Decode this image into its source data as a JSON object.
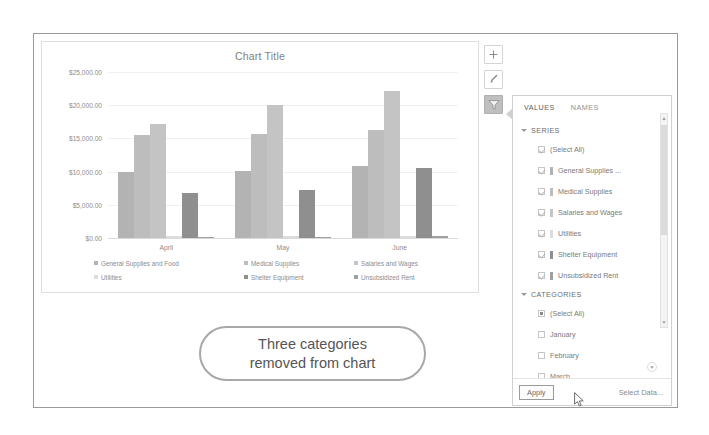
{
  "chart": {
    "title": "Chart Title",
    "buttons": [
      {
        "name": "chart-elements-button",
        "icon": "plus-icon",
        "glyph": "+"
      },
      {
        "name": "chart-styles-button",
        "icon": "paintbrush-icon",
        "glyph": "✎"
      },
      {
        "name": "chart-filters-button",
        "icon": "funnel-icon",
        "glyph": "▼"
      }
    ]
  },
  "chart_data": {
    "type": "bar",
    "title": "Chart Title",
    "xlabel": "",
    "ylabel": "",
    "ylim": [
      0,
      25000
    ],
    "grid": true,
    "legend_position": "bottom",
    "categories": [
      "April",
      "May",
      "June"
    ],
    "ytick_labels": [
      "$25,000.00",
      "$20,000.00",
      "$15,000.00",
      "$10,000.00",
      "$5,000.00",
      "$0.00"
    ],
    "ytick_values": [
      25000,
      20000,
      15000,
      10000,
      5000,
      0
    ],
    "series": [
      {
        "name": "General Supplies and Food",
        "color": "#b3b3b3",
        "values": [
          10000,
          10100,
          10800
        ]
      },
      {
        "name": "Medical Supplies",
        "color": "#bdbdbd",
        "values": [
          15500,
          15700,
          16300
        ]
      },
      {
        "name": "Salaries and Wages",
        "color": "#c4c4c4",
        "values": [
          17200,
          20100,
          22200
        ]
      },
      {
        "name": "Utilities",
        "color": "#dcdcdc",
        "values": [
          250,
          260,
          280
        ]
      },
      {
        "name": "Shelter Equipment",
        "color": "#8f8f8f",
        "values": [
          6800,
          7200,
          10500
        ]
      },
      {
        "name": "Unsubsidized Rent",
        "color": "#a0a0a0",
        "values": [
          200,
          210,
          230
        ]
      }
    ]
  },
  "filter_panel": {
    "tabs": [
      {
        "label": "VALUES",
        "active": true
      },
      {
        "label": "NAMES",
        "active": false
      }
    ],
    "sections": [
      {
        "title": "SERIES",
        "options": [
          {
            "label": "(Select All)",
            "state": "checked",
            "swatch": null
          },
          {
            "label": "General Supplies ...",
            "state": "checked",
            "swatch": "#b3b3b3"
          },
          {
            "label": "Medical Supplies",
            "state": "checked",
            "swatch": "#bdbdbd"
          },
          {
            "label": "Salaries and Wages",
            "state": "checked",
            "swatch": "#c4c4c4"
          },
          {
            "label": "Utilities",
            "state": "checked",
            "swatch": "#dcdcdc"
          },
          {
            "label": "Shelter Equipment",
            "state": "checked",
            "swatch": "#8f8f8f"
          },
          {
            "label": "Unsubsidized Rent",
            "state": "checked",
            "swatch": "#a0a0a0"
          }
        ]
      },
      {
        "title": "CATEGORIES",
        "options": [
          {
            "label": "(Select All)",
            "state": "partial",
            "swatch": null
          },
          {
            "label": "January",
            "state": "unchecked",
            "swatch": null
          },
          {
            "label": "February",
            "state": "unchecked",
            "swatch": null
          },
          {
            "label": "March",
            "state": "unchecked",
            "swatch": null
          }
        ]
      }
    ],
    "footer": {
      "apply_label": "Apply",
      "select_data_label": "Select Data..."
    },
    "scroll_arrow_up": "▲",
    "scroll_arrow_down": "▼",
    "more_arrow": "▼"
  },
  "callout": {
    "line1": "Three categories",
    "line2": "removed from chart"
  }
}
